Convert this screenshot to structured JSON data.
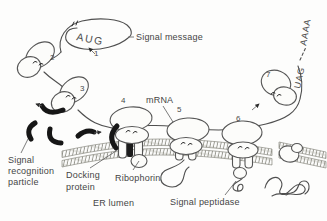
{
  "labels": {
    "signal_message": "Signal message",
    "mrna": "mRNA",
    "srp_line1": "Signal",
    "srp_line2": "recognition",
    "srp_line3": "particle",
    "docking_line1": "Docking",
    "docking_line2": "protein",
    "ribophorin": "Ribophorin",
    "er_lumen": "ER lumen",
    "signal_peptidase": "Signal peptidase"
  },
  "codons": {
    "start": "AUG",
    "stop": "UAG",
    "poly_a_tail": "AAAA"
  },
  "steps": {
    "s1": "1",
    "s2": "2",
    "s3": "3",
    "s4": "4",
    "s5": "5",
    "s6": "6",
    "s7": "7"
  },
  "colors": {
    "ink": "#4f4f4f",
    "srp_black": "#161616",
    "paper": "#fdfdfc",
    "membrane_hatch": "#8f8f86"
  }
}
